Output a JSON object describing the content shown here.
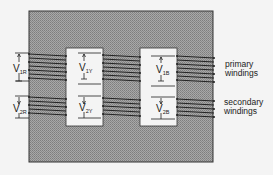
{
  "diagram": {
    "type": "three-phase core-type transformer",
    "core": {
      "fill": "#9a9a9a",
      "border": "#333333"
    },
    "phases": [
      {
        "name": "R",
        "primary_label": "V",
        "primary_sub": "1R",
        "secondary_label": "V",
        "secondary_sub": "2R"
      },
      {
        "name": "Y",
        "primary_label": "V",
        "primary_sub": "1Y",
        "secondary_label": "V",
        "secondary_sub": "2Y"
      },
      {
        "name": "B",
        "primary_label": "V",
        "primary_sub": "1B",
        "secondary_label": "V",
        "secondary_sub": "2B"
      }
    ],
    "labels": {
      "primary_line1": "primary",
      "primary_line2": "windings",
      "secondary_line1": "secondary",
      "secondary_line2": "windings"
    }
  }
}
